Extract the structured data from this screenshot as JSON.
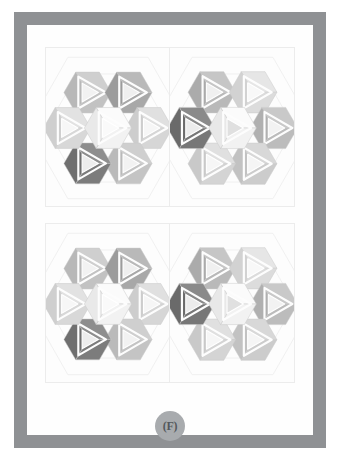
{
  "figure": {
    "label": "(F)",
    "frame_color": "#8f9194",
    "page_color": "#fefefe",
    "panel_bg": "#fdfdfd",
    "panel_border": "#ececec",
    "guide_line_color": "#f0f0f0",
    "badge_color": "#a8abae",
    "badge_text_color": "#54585c"
  },
  "palette": {
    "white": "#fbfbfb",
    "near_white": "#f4f4f4",
    "light1": "#e4e4e4",
    "light2": "#dcdcdc",
    "mid_light": "#d2d2d2",
    "mid": "#c4c4c4",
    "mid_dark": "#b4b4b4",
    "dark": "#9a9a9a",
    "darker": "#8a8a8a",
    "darkest": "#6f6f6f",
    "very_dark": "#5e5e5e",
    "edge": "#c9c9c9"
  },
  "panels": [
    {
      "id": "panel-top",
      "halves": [
        {
          "id": "top-left",
          "cluster": {
            "id": "cluster-top-left",
            "hexes": [
              {
                "pos": "center",
                "faces": [
                  "#fbfbfb",
                  "#f2f2f2",
                  "#e9e9e9"
                ],
                "center": "#fafafa"
              },
              {
                "pos": "north-west",
                "faces": [
                  "#cfcfcf",
                  "#c2c2c2",
                  "#b8b8b8"
                ],
                "center": "#f2f2f2"
              },
              {
                "pos": "north-east",
                "faces": [
                  "#b9b9b9",
                  "#a8a8a8",
                  "#9c9c9c"
                ],
                "center": "#efefef"
              },
              {
                "pos": "east",
                "faces": [
                  "#e0e0e0",
                  "#d6d6d6",
                  "#cdcdcd"
                ],
                "center": "#f6f6f6"
              },
              {
                "pos": "south-east",
                "faces": [
                  "#cfcfcf",
                  "#c4c4c4",
                  "#bababa"
                ],
                "center": "#f2f2f2"
              },
              {
                "pos": "south-west",
                "faces": [
                  "#8e8e8e",
                  "#7c7c7c",
                  "#6f6f6f"
                ],
                "center": "#ededed"
              },
              {
                "pos": "west",
                "faces": [
                  "#e2e2e2",
                  "#d8d8d8",
                  "#cfcfcf"
                ],
                "center": "#f7f7f7"
              }
            ]
          }
        },
        {
          "id": "top-right",
          "cluster": {
            "id": "cluster-top-right",
            "hexes": [
              {
                "pos": "center",
                "faces": [
                  "#fbfbfb",
                  "#f2f2f2",
                  "#e8e8e8"
                ],
                "center": "#e0e0e0"
              },
              {
                "pos": "north-west",
                "faces": [
                  "#c6c6c6",
                  "#b9b9b9",
                  "#ababab"
                ],
                "center": "#f0f0f0"
              },
              {
                "pos": "north-east",
                "faces": [
                  "#e6e6e6",
                  "#dcdcdc",
                  "#d2d2d2"
                ],
                "center": "#f8f8f8"
              },
              {
                "pos": "east",
                "faces": [
                  "#c9c9c9",
                  "#bcbcbc",
                  "#b0b0b0"
                ],
                "center": "#f2f2f2"
              },
              {
                "pos": "south-east",
                "faces": [
                  "#d8d8d8",
                  "#cccccc",
                  "#c2c2c2"
                ],
                "center": "#f5f5f5"
              },
              {
                "pos": "south-west",
                "faces": [
                  "#e0e0e0",
                  "#d4d4d4",
                  "#c9c9c9"
                ],
                "center": "#f6f6f6"
              },
              {
                "pos": "west",
                "faces": [
                  "#8a8a8a",
                  "#777777",
                  "#6a6a6a"
                ],
                "center": "#ececec"
              }
            ]
          }
        }
      ]
    },
    {
      "id": "panel-bottom",
      "halves": [
        {
          "id": "bottom-left",
          "cluster": {
            "id": "cluster-bottom-left",
            "hexes": [
              {
                "pos": "center",
                "faces": [
                  "#fbfbfb",
                  "#f2f2f2",
                  "#e9e9e9"
                ],
                "center": "#fafafa"
              },
              {
                "pos": "north-west",
                "faces": [
                  "#cfcfcf",
                  "#c2c2c2",
                  "#b8b8b8"
                ],
                "center": "#f2f2f2"
              },
              {
                "pos": "north-east",
                "faces": [
                  "#b9b9b9",
                  "#a8a8a8",
                  "#9c9c9c"
                ],
                "center": "#efefef"
              },
              {
                "pos": "east",
                "faces": [
                  "#e0e0e0",
                  "#d6d6d6",
                  "#cdcdcd"
                ],
                "center": "#f6f6f6"
              },
              {
                "pos": "south-east",
                "faces": [
                  "#cfcfcf",
                  "#c4c4c4",
                  "#bababa"
                ],
                "center": "#f2f2f2"
              },
              {
                "pos": "south-west",
                "faces": [
                  "#8e8e8e",
                  "#7c7c7c",
                  "#6f6f6f"
                ],
                "center": "#ededed"
              },
              {
                "pos": "west",
                "faces": [
                  "#e2e2e2",
                  "#d8d8d8",
                  "#cfcfcf"
                ],
                "center": "#f7f7f7"
              }
            ]
          }
        },
        {
          "id": "bottom-right",
          "cluster": {
            "id": "cluster-bottom-right",
            "hexes": [
              {
                "pos": "center",
                "faces": [
                  "#fbfbfb",
                  "#f2f2f2",
                  "#e8e8e8"
                ],
                "center": "#e0e0e0"
              },
              {
                "pos": "north-west",
                "faces": [
                  "#c6c6c6",
                  "#b9b9b9",
                  "#ababab"
                ],
                "center": "#f0f0f0"
              },
              {
                "pos": "north-east",
                "faces": [
                  "#e6e6e6",
                  "#dcdcdc",
                  "#d2d2d2"
                ],
                "center": "#f8f8f8"
              },
              {
                "pos": "east",
                "faces": [
                  "#c9c9c9",
                  "#bcbcbc",
                  "#b0b0b0"
                ],
                "center": "#f2f2f2"
              },
              {
                "pos": "south-east",
                "faces": [
                  "#d8d8d8",
                  "#cccccc",
                  "#c2c2c2"
                ],
                "center": "#f5f5f5"
              },
              {
                "pos": "south-west",
                "faces": [
                  "#e0e0e0",
                  "#d4d4d4",
                  "#c9c9c9"
                ],
                "center": "#f6f6f6"
              },
              {
                "pos": "west",
                "faces": [
                  "#8a8a8a",
                  "#777777",
                  "#6a6a6a"
                ],
                "center": "#ececec"
              }
            ]
          }
        }
      ]
    }
  ],
  "geometry": {
    "hex_radius": 24,
    "cluster_center": {
      "x": 63,
      "y": 80
    },
    "offsets": {
      "center": [
        0,
        0
      ],
      "north-west": [
        -20.8,
        -36
      ],
      "north-east": [
        20.8,
        -36
      ],
      "east": [
        41.6,
        0
      ],
      "south-east": [
        20.8,
        36
      ],
      "south-west": [
        -20.8,
        36
      ],
      "west": [
        -41.6,
        0
      ]
    }
  }
}
